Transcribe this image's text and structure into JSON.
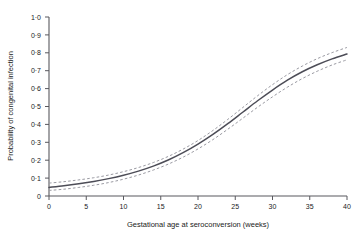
{
  "chart_data": {
    "type": "line",
    "title": "",
    "xlabel": "Gestational age at seroconversion (weeks)",
    "ylabel": "Probability of congenital infection",
    "xlim": [
      0,
      40
    ],
    "ylim": [
      0,
      1.0
    ],
    "grid": false,
    "legend": "none",
    "x_tick_labels": [
      "0",
      "5",
      "10",
      "15",
      "20",
      "25",
      "30",
      "35",
      "40"
    ],
    "x_ticks": [
      0,
      5,
      10,
      15,
      20,
      25,
      30,
      35,
      40
    ],
    "y_tick_labels": [
      "0",
      "0·1",
      "0·2",
      "0·3",
      "0·4",
      "0·5",
      "0·6",
      "0·7",
      "0·8",
      "0·9",
      "1·0"
    ],
    "y_ticks": [
      0,
      0.1,
      0.2,
      0.3,
      0.4,
      0.5,
      0.6,
      0.7,
      0.8,
      0.9,
      1.0
    ],
    "x": [
      0,
      2,
      4,
      6,
      8,
      10,
      12,
      14,
      16,
      18,
      20,
      22,
      24,
      26,
      28,
      30,
      32,
      34,
      36,
      38,
      40
    ],
    "series": [
      {
        "name": "Fitted probability",
        "style": "solid",
        "color": "#4d4d57",
        "values": [
          0.048,
          0.057,
          0.068,
          0.081,
          0.097,
          0.116,
          0.139,
          0.167,
          0.201,
          0.242,
          0.29,
          0.344,
          0.404,
          0.468,
          0.532,
          0.592,
          0.647,
          0.694,
          0.733,
          0.766,
          0.793
        ]
      },
      {
        "name": "95% CI upper",
        "style": "dashed",
        "color": "#9a9aa2",
        "values": [
          0.072,
          0.08,
          0.09,
          0.102,
          0.117,
          0.136,
          0.159,
          0.187,
          0.221,
          0.262,
          0.31,
          0.366,
          0.428,
          0.494,
          0.56,
          0.622,
          0.678,
          0.726,
          0.767,
          0.801,
          0.83
        ]
      },
      {
        "name": "95% CI lower",
        "style": "dashed",
        "color": "#9a9aa2",
        "values": [
          0.031,
          0.038,
          0.048,
          0.06,
          0.075,
          0.094,
          0.117,
          0.145,
          0.178,
          0.217,
          0.263,
          0.315,
          0.373,
          0.434,
          0.496,
          0.554,
          0.608,
          0.656,
          0.697,
          0.732,
          0.761
        ]
      }
    ]
  },
  "axes": {
    "x_title": "Gestational age at seroconversion (weeks)",
    "y_title": "Probability of congenital infection"
  }
}
